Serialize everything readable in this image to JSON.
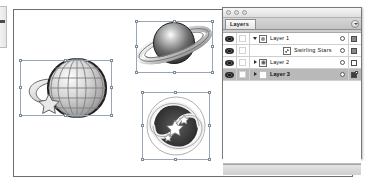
{
  "app": {
    "document_frame": "artboard",
    "canvas_background": "#ffffff"
  },
  "canvas": {
    "objects": [
      {
        "name": "wireframe-globe-with-arrow-and-star",
        "label": "Globe",
        "selected": true,
        "selection_handles": 8
      },
      {
        "name": "ringed-planet",
        "label": "Planet",
        "selected": true,
        "selection_handles": 8
      },
      {
        "name": "spiral-galaxy-with-stars",
        "label": "Swirling Stars",
        "selected": true,
        "selection_handles": 8
      }
    ]
  },
  "palette": {
    "tab_label": "Layers",
    "menu_icon": "panel-menu-icon",
    "window_dots": [
      "close-dot",
      "minimize-dot",
      "zoom-dot"
    ],
    "columns": {
      "visibility": "eye-icon",
      "lock": "lock-toggle",
      "name": "Name",
      "target": "target-circle-icon",
      "selection": "selection-swatch"
    },
    "rows": [
      {
        "name": "Layer 1",
        "visible": true,
        "locked": false,
        "expanded": true,
        "disclosure": "down",
        "indent": 0,
        "thumb": "art-globe",
        "selected": false,
        "target": "target-circle-icon",
        "swatch": "filled"
      },
      {
        "name": "Swirling Stars",
        "visible": true,
        "locked": false,
        "expanded": false,
        "disclosure": "none",
        "indent": 1,
        "thumb": "art-spiral",
        "selected": false,
        "target": "target-circle-icon",
        "swatch": "filled"
      },
      {
        "name": "Layer 2",
        "visible": true,
        "locked": false,
        "expanded": false,
        "disclosure": "right",
        "indent": 0,
        "thumb": "art-planet",
        "selected": false,
        "target": "target-circle-icon",
        "swatch": "hollow"
      },
      {
        "name": "Layer 3",
        "visible": true,
        "locked": false,
        "expanded": false,
        "disclosure": "right",
        "indent": 0,
        "thumb": "art-empty",
        "selected": true,
        "target": "target-circle-icon",
        "swatch": "dark-marked"
      }
    ]
  },
  "toolbar": {
    "partial": true,
    "visible_tool": "tool-sliver"
  }
}
